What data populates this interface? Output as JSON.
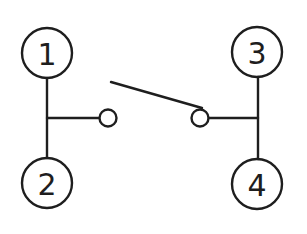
{
  "diagram": {
    "type": "switch-schematic",
    "terminals": [
      {
        "id": "t1",
        "label": "1",
        "cx": 47,
        "cy": 53
      },
      {
        "id": "t2",
        "label": "2",
        "cx": 47,
        "cy": 183
      },
      {
        "id": "t3",
        "label": "3",
        "cx": 257,
        "cy": 52
      },
      {
        "id": "t4",
        "label": "4",
        "cx": 257,
        "cy": 184
      }
    ],
    "contacts": [
      {
        "id": "left-contact",
        "cx": 108,
        "cy": 118
      },
      {
        "id": "right-contact",
        "cx": 200,
        "cy": 118
      }
    ],
    "lever": {
      "x1": 111,
      "y1": 82,
      "x2": 202,
      "y2": 108
    },
    "colors": {
      "line": "#1e1e1e",
      "background": "#ffffff"
    }
  }
}
